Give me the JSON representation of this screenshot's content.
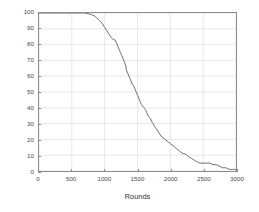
{
  "chart_data": {
    "type": "line",
    "title": "",
    "subtitle": "",
    "xlabel": "Rounds",
    "ylabel": "Number of Live Nodes",
    "xlim": [
      0,
      3000
    ],
    "ylim": [
      0,
      100
    ],
    "xticks": [
      0,
      500,
      1000,
      1500,
      2000,
      2500,
      3000
    ],
    "xtick_labels": [
      "0",
      "500",
      "1000",
      "1500",
      "2000",
      "2500",
      "3000"
    ],
    "yticks": [
      0,
      10,
      20,
      30,
      40,
      50,
      60,
      70,
      80,
      90,
      100
    ],
    "ytick_labels": [
      "0",
      "10",
      "20",
      "30",
      "40",
      "50",
      "60",
      "70",
      "80",
      "90",
      "100"
    ],
    "grid": true,
    "grid_color": "#d8d8d8",
    "legend": null,
    "legend_position": "none",
    "axes_color": "#8c8c8c",
    "background": "#ffffff",
    "series": [
      {
        "name": "Live Nodes",
        "color": "#6e6e6e",
        "linewidth": 1.0,
        "x": [
          0,
          100,
          200,
          300,
          400,
          500,
          600,
          700,
          800,
          850,
          900,
          950,
          1000,
          1030,
          1060,
          1090,
          1110,
          1140,
          1160,
          1180,
          1200,
          1220,
          1240,
          1260,
          1280,
          1300,
          1320,
          1330,
          1350,
          1370,
          1390,
          1400,
          1420,
          1440,
          1460,
          1480,
          1500,
          1520,
          1540,
          1560,
          1580,
          1600,
          1620,
          1640,
          1660,
          1680,
          1700,
          1720,
          1740,
          1760,
          1780,
          1800,
          1830,
          1860,
          1890,
          1920,
          1950,
          1980,
          2010,
          2040,
          2070,
          2100,
          2130,
          2160,
          2190,
          2220,
          2250,
          2280,
          2320,
          2360,
          2400,
          2450,
          2500,
          2550,
          2600,
          2650,
          2700,
          2750,
          2800,
          2850,
          2900,
          2950,
          3000
        ],
        "y": [
          100,
          100,
          100,
          100,
          100,
          100,
          100,
          100,
          99,
          98,
          96,
          94,
          91,
          89,
          87,
          85,
          84,
          83,
          83,
          81,
          79,
          77,
          75,
          73,
          71,
          69,
          67,
          64,
          62,
          60,
          58,
          57,
          55,
          54,
          52,
          50,
          48,
          46,
          44,
          42,
          41,
          40,
          39,
          37,
          35,
          34,
          33,
          31,
          30,
          28,
          27,
          26,
          24,
          22,
          21,
          20,
          19,
          18,
          17,
          16,
          15,
          14,
          13,
          12,
          11,
          11,
          10,
          9,
          8,
          7,
          6,
          5,
          5,
          5,
          5,
          4,
          4,
          3,
          2,
          2,
          1,
          1,
          1
        ]
      }
    ]
  }
}
